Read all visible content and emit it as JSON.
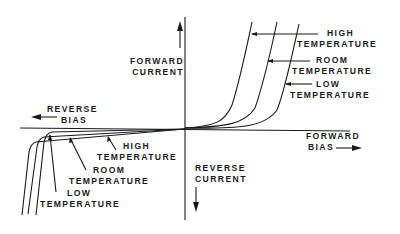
{
  "diagram": {
    "axes": {
      "forward_current": [
        "FORWARD",
        "CURRENT"
      ],
      "reverse_current": [
        "REVERSE",
        "CURRENT"
      ],
      "forward_bias": [
        "FORWARD",
        "BIAS"
      ],
      "reverse_bias": [
        "REVERSE",
        "BIAS"
      ]
    },
    "forward_labels": {
      "high": [
        "HIGH",
        "TEMPERATURE"
      ],
      "room": [
        "ROOM",
        "TEMPERATURE"
      ],
      "low": [
        "LOW",
        "TEMPERATURE"
      ]
    },
    "reverse_labels": {
      "high": [
        "HIGH",
        "TEMPERATURE"
      ],
      "room": [
        "ROOM",
        "TEMPERATURE"
      ],
      "low": [
        "LOW",
        "TEMPERATURE"
      ]
    },
    "colors": {
      "ink": "#1a1a1a",
      "background": "#ffffff"
    }
  }
}
